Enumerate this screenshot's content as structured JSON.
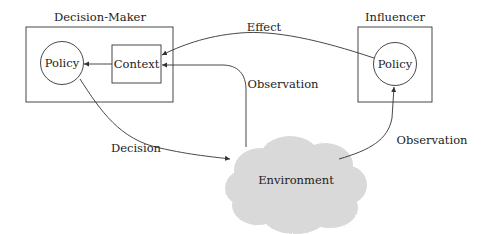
{
  "diagram": {
    "nodes": {
      "decision_maker": {
        "label": "Decision-Maker"
      },
      "dm_policy": {
        "label": "Policy"
      },
      "context": {
        "label": "Context"
      },
      "influencer": {
        "label": "Influencer"
      },
      "inf_policy": {
        "label": "Policy"
      },
      "environment": {
        "label": "Environment"
      }
    },
    "edges": {
      "effect": {
        "label": "Effect",
        "from": "Influencer Policy",
        "to": "Context"
      },
      "observation_dm": {
        "label": "Observation",
        "from": "Environment",
        "to": "Context"
      },
      "context_to_policy": {
        "label": "",
        "from": "Context",
        "to": "Decision-Maker Policy"
      },
      "decision": {
        "label": "Decision",
        "from": "Decision-Maker Policy",
        "to": "Environment"
      },
      "observation_inf": {
        "label": "Observation",
        "from": "Environment",
        "to": "Influencer Policy"
      }
    },
    "colors": {
      "stroke": "#333333",
      "cloud_fill": "#d9d9d9",
      "text": "#222222"
    }
  }
}
